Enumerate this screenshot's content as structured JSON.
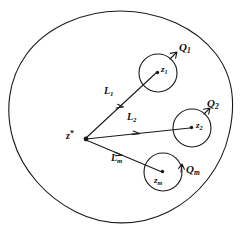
{
  "figure": {
    "type": "mathematical-diagram",
    "stroke_color": "#1a1a1a",
    "background_color": "#ffffff",
    "source_point": {
      "name": "z-star",
      "base": "z",
      "sup": "*",
      "x": 82,
      "y": 137
    },
    "outer_contour": {
      "name": "outer-boundary-curve",
      "closed": true
    },
    "circles": [
      {
        "id": "q1",
        "center_label_base": "z",
        "center_label_sub": "1",
        "circle_label_base": "Q",
        "circle_label_sub": "1",
        "cx": 158,
        "cy": 73,
        "r": 19,
        "center_label_x": 161,
        "center_label_y": 68,
        "circle_label_x": 180,
        "circle_label_y": 48,
        "orientation": "counterclockwise"
      },
      {
        "id": "q2",
        "center_label_base": "z",
        "center_label_sub": "2",
        "circle_label_base": "Q",
        "circle_label_sub": "2",
        "cx": 192,
        "cy": 128,
        "r": 19,
        "center_label_x": 196,
        "center_label_y": 124,
        "circle_label_x": 207,
        "circle_label_y": 104,
        "orientation": "counterclockwise"
      },
      {
        "id": "qm",
        "center_label_base": "z",
        "center_label_sub": "m",
        "circle_label_base": "Q",
        "circle_label_sub": "m",
        "cx": 163,
        "cy": 172,
        "r": 19,
        "center_label_x": 155,
        "center_label_y": 177,
        "circle_label_x": 186,
        "circle_label_y": 170,
        "orientation": "counterclockwise"
      }
    ],
    "paths": [
      {
        "id": "l1",
        "label_base": "L",
        "label_sub": "1",
        "from_x": 86,
        "from_y": 138,
        "to_x": 156,
        "to_y": 73,
        "label_x": 106,
        "label_y": 92,
        "arrow_t": 0.52
      },
      {
        "id": "l2",
        "label_base": "L",
        "label_sub": "2",
        "from_x": 86,
        "from_y": 139,
        "to_x": 190,
        "to_y": 128,
        "label_x": 129,
        "label_y": 117,
        "arrow_t": 0.52
      },
      {
        "id": "lm",
        "label_base": "L",
        "label_sub": "m",
        "from_x": 86,
        "from_y": 140,
        "to_x": 162,
        "to_y": 172,
        "label_x": 113,
        "label_y": 158,
        "arrow_t": 0.48
      }
    ]
  }
}
